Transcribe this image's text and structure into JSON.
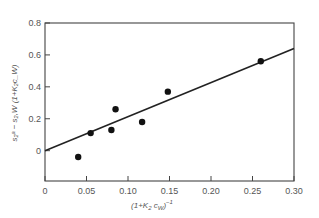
{
  "chart_data": {
    "type": "scatter",
    "title": "",
    "xlabel": "(1+K2 cw)^-1",
    "ylabel": "s2^a - s2,W (1+K2 cw)",
    "xlim": [
      0,
      0.3
    ],
    "ylim": [
      -0.19,
      0.8
    ],
    "grid": false,
    "legend": "none",
    "x_ticks": [
      "0",
      "0.05",
      "0.10",
      "0.15",
      "0.20",
      "0.25",
      "0.30"
    ],
    "y_ticks": [
      "0",
      "0.2",
      "0.4",
      "0.6",
      "0.8"
    ],
    "series": [
      {
        "name": "data",
        "kind": "scatter",
        "x": [
          0.04,
          0.055,
          0.08,
          0.085,
          0.117,
          0.148,
          0.26
        ],
        "y": [
          -0.04,
          0.11,
          0.13,
          0.26,
          0.18,
          0.37,
          0.56
        ]
      },
      {
        "name": "fit",
        "kind": "line",
        "x": [
          0,
          0.3
        ],
        "y": [
          0,
          0.64
        ]
      }
    ]
  },
  "labels": {
    "xlabel_main": "(1+K",
    "xlabel_sub": "2",
    "xlabel_c": " c",
    "xlabel_csub": "W",
    "xlabel_tail": ")",
    "xlabel_sup": "−1",
    "ylabel_text": "s₂ᵃ − s₂,W (1+K₂c_W)"
  }
}
